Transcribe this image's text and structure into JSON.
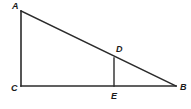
{
  "figure": {
    "type": "geometry-diagram",
    "shape": "right-triangle-with-cevian",
    "canvas": {
      "width": 191,
      "height": 109,
      "background": "#ffffff"
    },
    "stroke_color": "#2b2b2b",
    "label_color": "#1a1a1a",
    "vertices": {
      "A": {
        "label": "A",
        "x": 21,
        "y": 11
      },
      "B": {
        "label": "B",
        "x": 176,
        "y": 86
      },
      "C": {
        "label": "C",
        "x": 21,
        "y": 86
      },
      "D": {
        "label": "D",
        "x": 114,
        "y": 58
      },
      "E": {
        "label": "E",
        "x": 114,
        "y": 86
      }
    },
    "segments": [
      {
        "name": "AC",
        "from": "A",
        "to": "C"
      },
      {
        "name": "CB",
        "from": "C",
        "to": "B"
      },
      {
        "name": "AB",
        "from": "A",
        "to": "B"
      },
      {
        "name": "DE",
        "from": "D",
        "to": "E"
      }
    ]
  }
}
